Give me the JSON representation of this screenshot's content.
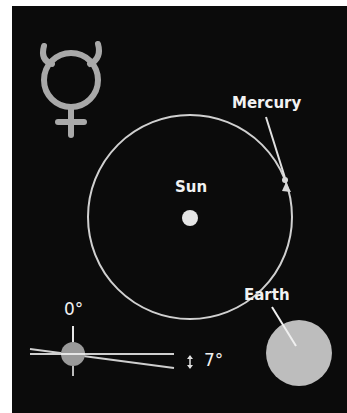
{
  "diagram": {
    "title_symbol": "mercury-astronomical-symbol",
    "labels": {
      "planet": "Mercury",
      "star": "Sun",
      "earth": "Earth",
      "reference_angle": "0°",
      "inclination_angle": "7°"
    },
    "colors": {
      "background": "#0b0b0b",
      "line": "#d9d9d9",
      "sun": "#e6e6e6",
      "earth": "#bdbdbd",
      "symbol": "#a9a9a9",
      "text": "#f2f2f2"
    }
  }
}
